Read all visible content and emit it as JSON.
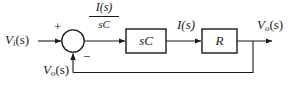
{
  "diagram": {
    "type": "control-block-diagram",
    "line_color": "#1a1a1a",
    "background_color": "#ffffff",
    "input": {
      "symbol": "V",
      "subscript": "i",
      "arg": "(s)",
      "full": "Vi(s)"
    },
    "output": {
      "symbol": "V",
      "subscript": "o",
      "arg": "(s)",
      "full": "Vo(s)"
    },
    "feedback": {
      "symbol": "V",
      "subscript": "o",
      "arg": "(s)",
      "full": "Vo(s)"
    },
    "summing_junction": {
      "name": "summing-junction",
      "plus_sign": "+",
      "minus_sign": "−"
    },
    "signal_labels": {
      "before_first_block_numerator": "I(s)",
      "before_first_block_denominator": "sC",
      "between_blocks": "I(s)"
    },
    "blocks": [
      {
        "id": "block-sc",
        "label": "sC"
      },
      {
        "id": "block-r",
        "label": "R"
      }
    ]
  }
}
